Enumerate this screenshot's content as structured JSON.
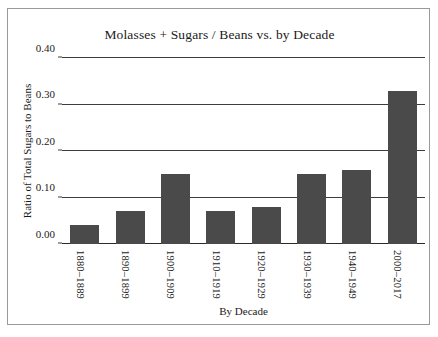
{
  "chart_data": {
    "type": "bar",
    "title": "Molasses + Sugars / Beans vs. by Decade",
    "xlabel": "By Decade",
    "ylabel": "Ratio of Total Sugars to Beans",
    "categories": [
      "1880–1889",
      "1890–1899",
      "1900–1909",
      "1910–1919",
      "1920–1929",
      "1930–1939",
      "1940–1949",
      "2000–2017"
    ],
    "values": [
      0.04,
      0.07,
      0.15,
      0.07,
      0.08,
      0.15,
      0.16,
      0.33
    ],
    "ylim": [
      0.0,
      0.4
    ],
    "yticks": [
      0.0,
      0.1,
      0.2,
      0.3,
      0.4
    ],
    "ytick_labels": [
      "0.00",
      "0.10",
      "0.20",
      "0.30",
      "0.40"
    ],
    "grid": "horizontal",
    "legend": "none",
    "bar_color": "#4a4a4a",
    "grid_color": "#3d3d3d",
    "background_color": "#ffffff"
  }
}
